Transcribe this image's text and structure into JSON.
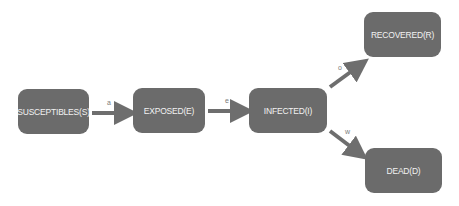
{
  "diagram": {
    "nodes": [
      {
        "id": "S",
        "label": "SUSCEPTIBLES(S)"
      },
      {
        "id": "E",
        "label": "EXPOSED(E)"
      },
      {
        "id": "I",
        "label": "INFECTED(I)"
      },
      {
        "id": "R",
        "label": "RECOVERED(R)"
      },
      {
        "id": "D",
        "label": "DEAD(D)"
      }
    ],
    "edges": [
      {
        "from": "S",
        "to": "E",
        "label": "a"
      },
      {
        "from": "E",
        "to": "I",
        "label": "e"
      },
      {
        "from": "I",
        "to": "R",
        "label": "o"
      },
      {
        "from": "I",
        "to": "D",
        "label": "w"
      }
    ],
    "colors": {
      "node_fill": "#6b6b6b",
      "node_text": "#f2f2f2",
      "arrow": "#6e6e6e",
      "label": "#7a7a7a"
    }
  }
}
